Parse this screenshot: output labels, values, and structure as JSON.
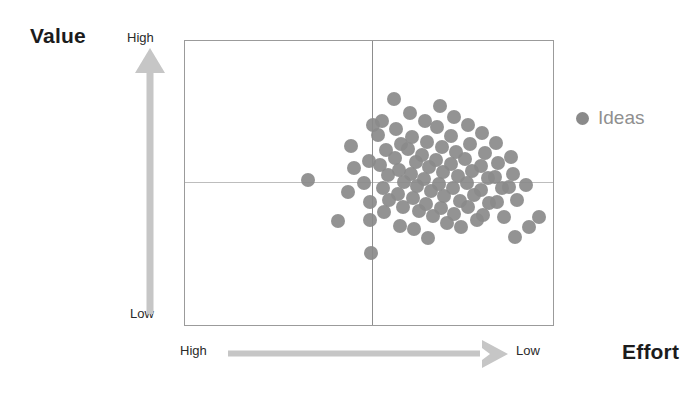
{
  "axes": {
    "y": {
      "title": "Value",
      "high_label": "High",
      "low_label": "Low",
      "arrow_icon": "arrow-up-icon",
      "direction": "up"
    },
    "x": {
      "title": "Effort",
      "high_label": "High",
      "low_label": "Low",
      "arrow_icon": "arrow-right-icon",
      "direction": "right"
    }
  },
  "legend": {
    "position": "right",
    "items": [
      {
        "label": "Ideas",
        "color": "#8a8a8a",
        "marker": "circle"
      }
    ]
  },
  "colors": {
    "dot": "#8a8a8a",
    "frame": "#9b9b9b",
    "gridline": "#bdbdbd",
    "midline_vertical": "#8d8d8d",
    "arrow": "#c4c4c4",
    "title_text": "#1c1c1c",
    "scale_text": "#2a2a2a",
    "legend_text": "#8f8f8f",
    "background": "#ffffff"
  },
  "chart_data": {
    "type": "scatter",
    "title": "",
    "xlabel": "Effort",
    "ylabel": "Value",
    "xlim": [
      0,
      100
    ],
    "ylim": [
      0,
      100
    ],
    "x_axis_note": "x increases left-to-right from High effort to Low effort",
    "y_axis_note": "y increases bottom-to-top from Low value to High value",
    "grid": true,
    "gridlines": {
      "x": [
        50.8
      ],
      "y": [
        50.3
      ]
    },
    "legend_position": "right",
    "series": [
      {
        "name": "Ideas",
        "color": "#8a8a8a",
        "marker": "circle",
        "marker_size": 14,
        "points": [
          [
            33.5,
            51.0
          ],
          [
            41.6,
            36.5
          ],
          [
            45.1,
            63.1
          ],
          [
            45.9,
            55.2
          ],
          [
            44.3,
            46.9
          ],
          [
            48.6,
            50.0
          ],
          [
            50.0,
            57.7
          ],
          [
            50.3,
            43.4
          ],
          [
            50.3,
            37.1
          ],
          [
            50.5,
            25.5
          ],
          [
            51.1,
            70.3
          ],
          [
            52.4,
            66.8
          ],
          [
            53.5,
            72.0
          ],
          [
            54.6,
            61.5
          ],
          [
            53.0,
            56.3
          ],
          [
            55.1,
            52.8
          ],
          [
            53.8,
            48.3
          ],
          [
            55.4,
            44.1
          ],
          [
            54.1,
            39.9
          ],
          [
            56.8,
            79.7
          ],
          [
            57.3,
            68.9
          ],
          [
            58.6,
            63.6
          ],
          [
            57.0,
            58.7
          ],
          [
            58.1,
            54.5
          ],
          [
            59.5,
            50.3
          ],
          [
            57.8,
            46.2
          ],
          [
            59.2,
            41.6
          ],
          [
            58.4,
            35.0
          ],
          [
            61.1,
            74.8
          ],
          [
            61.6,
            66.1
          ],
          [
            60.5,
            61.9
          ],
          [
            62.7,
            57.3
          ],
          [
            61.4,
            53.1
          ],
          [
            63.0,
            49.0
          ],
          [
            61.9,
            44.8
          ],
          [
            63.5,
            40.2
          ],
          [
            62.2,
            33.9
          ],
          [
            65.1,
            71.7
          ],
          [
            65.7,
            64.3
          ],
          [
            64.3,
            59.8
          ],
          [
            66.2,
            55.6
          ],
          [
            64.9,
            51.4
          ],
          [
            66.8,
            47.2
          ],
          [
            65.4,
            42.7
          ],
          [
            67.3,
            38.5
          ],
          [
            66.0,
            30.8
          ],
          [
            69.2,
            77.3
          ],
          [
            68.6,
            69.6
          ],
          [
            69.7,
            62.6
          ],
          [
            68.1,
            58.0
          ],
          [
            70.0,
            53.8
          ],
          [
            68.9,
            49.6
          ],
          [
            70.5,
            45.5
          ],
          [
            69.5,
            41.3
          ],
          [
            71.1,
            36.0
          ],
          [
            73.0,
            73.1
          ],
          [
            72.4,
            66.4
          ],
          [
            73.5,
            60.8
          ],
          [
            72.2,
            56.6
          ],
          [
            74.1,
            52.4
          ],
          [
            72.7,
            48.3
          ],
          [
            74.6,
            43.7
          ],
          [
            73.2,
            39.2
          ],
          [
            75.1,
            34.6
          ],
          [
            76.8,
            70.6
          ],
          [
            77.3,
            63.6
          ],
          [
            76.2,
            58.4
          ],
          [
            78.1,
            54.2
          ],
          [
            76.5,
            50.0
          ],
          [
            78.6,
            45.8
          ],
          [
            77.0,
            41.6
          ],
          [
            79.2,
            37.1
          ],
          [
            80.8,
            67.5
          ],
          [
            81.4,
            60.5
          ],
          [
            80.3,
            55.9
          ],
          [
            82.2,
            51.7
          ],
          [
            80.5,
            47.6
          ],
          [
            82.7,
            43.0
          ],
          [
            81.1,
            38.8
          ],
          [
            84.6,
            64.0
          ],
          [
            85.1,
            57.0
          ],
          [
            84.1,
            52.1
          ],
          [
            86.2,
            48.3
          ],
          [
            84.9,
            43.4
          ],
          [
            86.8,
            38.1
          ],
          [
            88.6,
            59.1
          ],
          [
            89.2,
            53.1
          ],
          [
            88.1,
            48.6
          ],
          [
            90.3,
            44.1
          ],
          [
            89.7,
            31.1
          ],
          [
            92.7,
            49.3
          ],
          [
            93.5,
            34.6
          ],
          [
            96.2,
            38.1
          ]
        ]
      }
    ]
  }
}
